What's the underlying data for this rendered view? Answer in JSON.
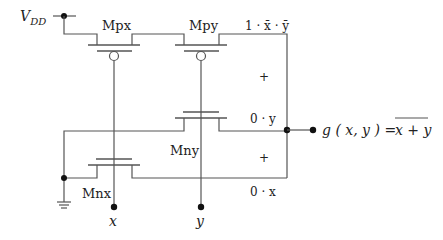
{
  "diagram": {
    "supply_label": "V",
    "supply_sub": "DD",
    "transistors": {
      "mpx": "Mpx",
      "mpy": "Mpy",
      "mny": "Mny",
      "mnx": "Mnx"
    },
    "inputs": {
      "x": "x",
      "y": "y"
    },
    "terms": {
      "top": "1 · x̄ · ȳ",
      "plus1": "+",
      "mid": "0 · y",
      "plus2": "+",
      "bottom": "0 · x"
    },
    "output": {
      "lhs": "g ( x, y ) =",
      "rhs": "x + y"
    }
  }
}
